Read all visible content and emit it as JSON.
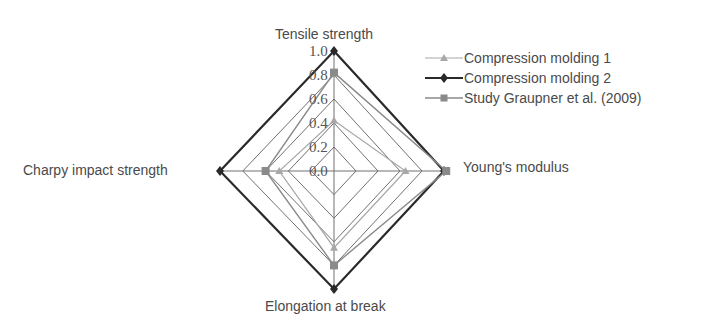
{
  "chart_data": {
    "type": "radar",
    "title": "",
    "axes": [
      "Tensile strength",
      "Young's modulus",
      "Elongation at break",
      "Charpy impact strength"
    ],
    "ticks": [
      "0.0",
      "0.2",
      "0.4",
      "0.6",
      "0.8",
      "1.0"
    ],
    "rlim": [
      0,
      1.0
    ],
    "grid": true,
    "legend_position": "top-right",
    "series": [
      {
        "name": "Compression molding 1",
        "marker": "triangle",
        "color": "#a8a8a8",
        "width": 1.2,
        "values": [
          0.42,
          0.65,
          0.65,
          0.48
        ]
      },
      {
        "name": "Compression molding 2",
        "marker": "diamond",
        "color": "#2a2a2a",
        "width": 2.2,
        "values": [
          1.0,
          1.0,
          1.0,
          1.0
        ]
      },
      {
        "name": "Study Graupner et al. (2009)",
        "marker": "square",
        "color": "#8a8a8a",
        "width": 1.4,
        "values": [
          0.82,
          1.02,
          0.8,
          0.6
        ]
      }
    ]
  },
  "labels": {
    "top": "Tensile strength",
    "right": "Young's modulus",
    "bottom": "Elongation at break",
    "left": "Charpy impact strength"
  },
  "tick_labels": {
    "t0": "0.0",
    "t1": "0.2",
    "t2": "0.4",
    "t3": "0.6",
    "t4": "0.8",
    "t5": "1.0"
  },
  "legend": {
    "items": [
      {
        "label": "Compression molding 1"
      },
      {
        "label": "Compression molding 2"
      },
      {
        "label": "Study Graupner et al. (2009)"
      }
    ]
  }
}
